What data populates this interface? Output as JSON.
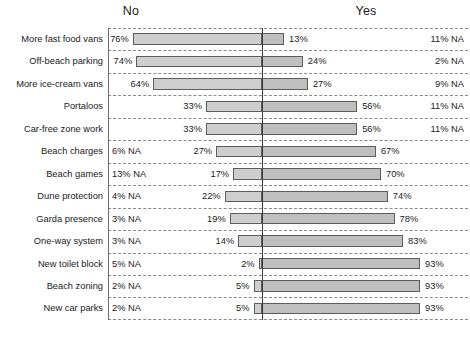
{
  "header": {
    "left_label": "No",
    "right_label": "Yes"
  },
  "chart_data": {
    "type": "bar",
    "orientation": "horizontal",
    "style": "diverging-bar",
    "title": "",
    "xlabel": "",
    "ylabel": "",
    "grid": true,
    "legend": false,
    "axis_labels": [
      "No",
      "Yes"
    ],
    "center_axis_value": 0,
    "units": "percent",
    "categories": [
      "More fast food vans",
      "Off-beach parking",
      "More ice-cream vans",
      "Portaloos",
      "Car-free zone work",
      "Beach charges",
      "Beach games",
      "Dune protection",
      "Garda presence",
      "One-way system",
      "New toilet block",
      "Beach zoning",
      "New car parks"
    ],
    "series": [
      {
        "name": "No",
        "direction": "left",
        "values": [
          76,
          74,
          64,
          33,
          33,
          27,
          17,
          22,
          19,
          14,
          2,
          5,
          5
        ],
        "labels": [
          "76%",
          "74%",
          "64%",
          "33%",
          "33%",
          "27%",
          "17%",
          "22%",
          "19%",
          "14%",
          "2%",
          "5%",
          "5%"
        ]
      },
      {
        "name": "Yes",
        "direction": "right",
        "values": [
          13,
          24,
          27,
          56,
          56,
          67,
          70,
          74,
          78,
          83,
          93,
          93,
          93
        ],
        "labels": [
          "13%",
          "24%",
          "27%",
          "56%",
          "56%",
          "67%",
          "70%",
          "74%",
          "78%",
          "83%",
          "93%",
          "93%",
          "93%"
        ]
      }
    ],
    "na_left": [
      "",
      "",
      "",
      "",
      "",
      "6% NA",
      "13% NA",
      "4% NA",
      "3% NA",
      "3% NA",
      "5% NA",
      "2% NA",
      "2% NA"
    ],
    "na_right": [
      "11% NA",
      "2% NA",
      "9% NA",
      "11% NA",
      "11% NA",
      "",
      "",
      "",
      "",
      "",
      "",
      "",
      ""
    ],
    "xlim": [
      0,
      100
    ],
    "colors": {
      "bar_fill": "#c9c9c9",
      "bar_stroke": "#5d5d5d",
      "grid": "#8a8a8a",
      "axis": "#3a3a3a",
      "text": "#1b1b1b",
      "background": "#ffffff"
    }
  }
}
